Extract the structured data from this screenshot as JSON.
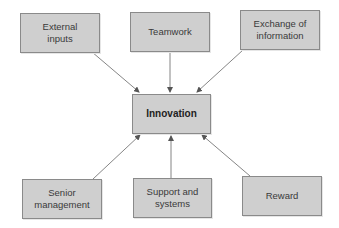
{
  "diagram": {
    "center": {
      "label": "Innovation"
    },
    "nodes": [
      {
        "id": "external-inputs",
        "label": "External\ninputs"
      },
      {
        "id": "teamwork",
        "label": "Teamwork"
      },
      {
        "id": "exchange-of-information",
        "label": "Exchange of\ninformation"
      },
      {
        "id": "senior-management",
        "label": "Senior\nmanagement"
      },
      {
        "id": "support-and-systems",
        "label": "Support and\nsystems"
      },
      {
        "id": "reward",
        "label": "Reward"
      }
    ],
    "edges": [
      {
        "from": "external-inputs",
        "to": "innovation"
      },
      {
        "from": "teamwork",
        "to": "innovation"
      },
      {
        "from": "exchange-of-information",
        "to": "innovation"
      },
      {
        "from": "senior-management",
        "to": "innovation"
      },
      {
        "from": "support-and-systems",
        "to": "innovation"
      },
      {
        "from": "reward",
        "to": "innovation"
      }
    ],
    "colors": {
      "box_fill": "#cfcfcf",
      "box_border": "#8a8a8a",
      "arrow": "#555555"
    }
  }
}
